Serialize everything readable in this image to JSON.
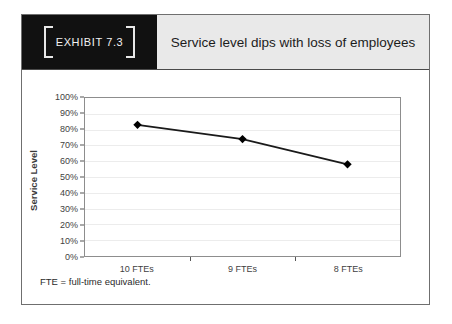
{
  "exhibit": {
    "tag_label": "EXHIBIT 7.3",
    "title": "Service level dips with loss of employees",
    "footnote": "FTE = full-time equivalent."
  },
  "colors": {
    "tag_background": "#111111",
    "tag_text": "#f2f2f2",
    "title_band": "#e9e9e9",
    "title_text": "#1c1c1c",
    "series_line": "#1a1a1a",
    "marker": "#000000",
    "gridline": "#ececec",
    "plot_border": "#8d8d8d",
    "frame_border": "#6f6f6f"
  },
  "chart_data": {
    "type": "line",
    "title": "Service level dips with loss of employees",
    "xlabel": "",
    "ylabel": "Service Level",
    "categories": [
      "10 FTEs",
      "9 FTEs",
      "8 FTEs"
    ],
    "values": [
      83,
      74,
      58
    ],
    "ylim": [
      0,
      100
    ],
    "ytick_labels": [
      "100%",
      "90%",
      "80%",
      "70%",
      "60%",
      "50%",
      "40%",
      "30%",
      "20%",
      "10%",
      "0%"
    ],
    "ytick_values": [
      100,
      90,
      80,
      70,
      60,
      50,
      40,
      30,
      20,
      10,
      0
    ],
    "ytick_step": 10,
    "grid": true,
    "legend": false,
    "marker": "diamond",
    "value_suffix": "%",
    "annotations": [
      "FTE = full-time equivalent."
    ]
  }
}
